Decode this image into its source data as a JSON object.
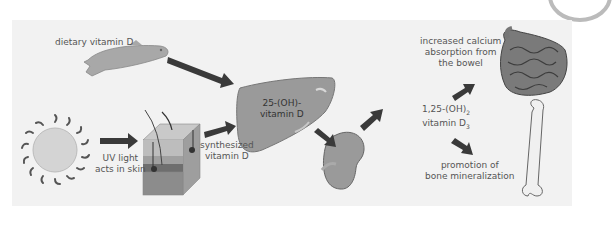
{
  "diagram": {
    "labels": {
      "dietary": "dietary vitamin D",
      "uv_line1": "UV light",
      "uv_line2": "acts in skin",
      "synth_line1": "synthesized",
      "synth_line2": "vitamin D",
      "liver_line1": "25-(OH)-",
      "liver_line2": "vitamin D",
      "active_line1": "1,25-(OH)",
      "active_sub": "2",
      "active_line2": "vitamin D",
      "active_sub2": "3",
      "bowel_line1": "increased calcium",
      "bowel_line2": "absorption from",
      "bowel_line3": "the bowel",
      "bone_line1": "promotion of",
      "bone_line2": "bone mineralization"
    },
    "nodes": [
      {
        "id": "fish",
        "icon": "fish-icon"
      },
      {
        "id": "sun",
        "icon": "sun-icon"
      },
      {
        "id": "skin",
        "icon": "skin-block-icon"
      },
      {
        "id": "liver",
        "icon": "liver-icon"
      },
      {
        "id": "kidney",
        "icon": "kidney-icon"
      },
      {
        "id": "intestine",
        "icon": "intestine-icon"
      },
      {
        "id": "bone",
        "icon": "femur-bone-icon"
      }
    ],
    "colors": {
      "panel": "#f2f2f2",
      "arrow": "#3a3a3a",
      "organ": "#9a9a9a",
      "text": "#555555"
    }
  }
}
